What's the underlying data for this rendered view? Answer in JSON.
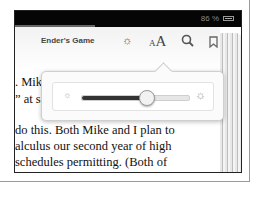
{
  "status_bar": {
    "battery_percent": "86 %"
  },
  "toolbar": {
    "book_title": "Ender's Game",
    "icons": [
      "brightness-icon",
      "font-size-icon",
      "search-icon",
      "bookmark-icon"
    ],
    "font_small": "A",
    "font_large": "A"
  },
  "brightness_popover": {
    "slider_percent": 58,
    "low_icon": "☼",
    "high_icon": "☼"
  },
  "page_text": {
    "lines": [
      ". Mik",
      "” at s",
      "do this. Both Mike and I plan to",
      "alculus our second year of high",
      " schedules permitting. (Both of",
      "nterested in science/math re-"
    ]
  },
  "colors": {
    "status_bar": "#050505",
    "slider_fill": "#333333"
  }
}
